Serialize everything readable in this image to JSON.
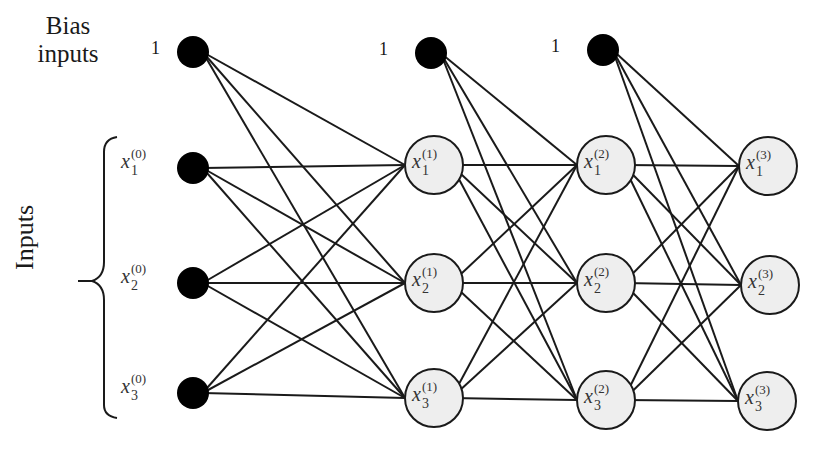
{
  "labels": {
    "bias_title_line1": "Bias",
    "bias_title_line2": "inputs",
    "inputs_title": "Inputs",
    "bias_value": "1"
  },
  "colors": {
    "line": "#1a1a1a",
    "bias_fill": "#000000",
    "input_fill": "#000000",
    "neuron_fill": "#eeeeee",
    "neuron_stroke": "#1a1a1a"
  },
  "layers": [
    {
      "name": "input",
      "bias": {
        "label": "1",
        "x": 193,
        "y": 52
      },
      "nodes": [
        {
          "var": "x",
          "sub": "1",
          "sup": "(0)",
          "x": 193,
          "y": 168
        },
        {
          "var": "x",
          "sub": "2",
          "sup": "(0)",
          "x": 193,
          "y": 283
        },
        {
          "var": "x",
          "sub": "3",
          "sup": "(0)",
          "x": 193,
          "y": 393
        }
      ]
    },
    {
      "name": "hidden-1",
      "bias": {
        "label": "1",
        "x": 431,
        "y": 53
      },
      "nodes": [
        {
          "var": "x",
          "sub": "1",
          "sup": "(1)",
          "x": 434,
          "y": 165
        },
        {
          "var": "x",
          "sub": "2",
          "sup": "(1)",
          "x": 434,
          "y": 283
        },
        {
          "var": "x",
          "sub": "3",
          "sup": "(1)",
          "x": 434,
          "y": 398
        }
      ]
    },
    {
      "name": "hidden-2",
      "bias": {
        "label": "1",
        "x": 603,
        "y": 50
      },
      "nodes": [
        {
          "var": "x",
          "sub": "1",
          "sup": "(2)",
          "x": 606,
          "y": 165
        },
        {
          "var": "x",
          "sub": "2",
          "sup": "(2)",
          "x": 606,
          "y": 283
        },
        {
          "var": "x",
          "sub": "3",
          "sup": "(2)",
          "x": 606,
          "y": 400
        }
      ]
    },
    {
      "name": "output",
      "nodes": [
        {
          "var": "x",
          "sub": "1",
          "sup": "(3)",
          "x": 768,
          "y": 166
        },
        {
          "var": "x",
          "sub": "2",
          "sup": "(3)",
          "x": 770,
          "y": 285
        },
        {
          "var": "x",
          "sub": "3",
          "sup": "(3)",
          "x": 767,
          "y": 401
        }
      ]
    }
  ]
}
